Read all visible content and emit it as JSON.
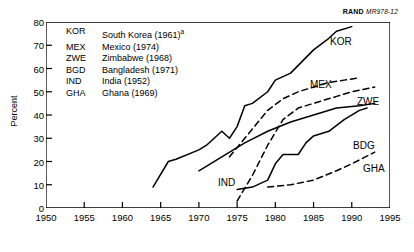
{
  "source_note": {
    "brand": "RAND",
    "id": "MR978-12"
  },
  "axes": {
    "ylabel": "Percent",
    "yticks": [
      0,
      10,
      20,
      30,
      40,
      50,
      60,
      70,
      80
    ],
    "xticks": [
      1950,
      1955,
      1960,
      1965,
      1970,
      1975,
      1980,
      1985,
      1990,
      1995
    ],
    "xlim": [
      1950,
      1995
    ],
    "ylim": [
      0,
      80
    ]
  },
  "legend": {
    "rows": [
      {
        "code": "KOR",
        "name": "South Korea (1961)",
        "footnote": "a"
      },
      {
        "code": "MEX",
        "name": "Mexico (1974)",
        "footnote": ""
      },
      {
        "code": "ZWE",
        "name": "Zimbabwe (1968)",
        "footnote": ""
      },
      {
        "code": "BGD",
        "name": "Bangladesh (1971)",
        "footnote": ""
      },
      {
        "code": "IND",
        "name": "India (1952)",
        "footnote": ""
      },
      {
        "code": "GHA",
        "name": "Ghana (1969)",
        "footnote": ""
      }
    ]
  },
  "series_labels": {
    "kor": "KOR",
    "mex": "MEX",
    "zwe": "ZWE",
    "bdg": "BDG",
    "ind": "IND",
    "gha": "GHA"
  },
  "chart_data": {
    "type": "line",
    "title": "",
    "xlabel": "",
    "ylabel": "Percent",
    "xlim": [
      1950,
      1995
    ],
    "ylim": [
      0,
      80
    ],
    "grid": false,
    "legend_position": "inside-top-left",
    "series": [
      {
        "name": "KOR",
        "label": "South Korea (1961)",
        "style": "solid",
        "points": [
          [
            1964,
            9
          ],
          [
            1966,
            20
          ],
          [
            1967,
            21
          ],
          [
            1970,
            25
          ],
          [
            1971,
            27
          ],
          [
            1972,
            30
          ],
          [
            1973,
            33
          ],
          [
            1974,
            30
          ],
          [
            1975,
            35
          ],
          [
            1976,
            44
          ],
          [
            1977,
            45
          ],
          [
            1979,
            50
          ],
          [
            1980,
            55
          ],
          [
            1982,
            58
          ],
          [
            1985,
            68
          ],
          [
            1987,
            73
          ],
          [
            1988,
            76
          ],
          [
            1990,
            78
          ]
        ]
      },
      {
        "name": "MEX",
        "label": "Mexico (1974)",
        "style": "dashed",
        "points": [
          [
            1974,
            22
          ],
          [
            1976,
            30
          ],
          [
            1978,
            38
          ],
          [
            1979,
            42
          ],
          [
            1981,
            47
          ],
          [
            1983,
            50
          ],
          [
            1985,
            52
          ],
          [
            1987,
            54
          ],
          [
            1989,
            55
          ],
          [
            1991,
            56
          ]
        ]
      },
      {
        "name": "ZWE",
        "label": "Zimbabwe (1968)",
        "style": "dashed",
        "points": [
          [
            1975,
            3
          ],
          [
            1977,
            14
          ],
          [
            1979,
            27
          ],
          [
            1981,
            38
          ],
          [
            1983,
            43
          ],
          [
            1985,
            45
          ],
          [
            1988,
            48
          ],
          [
            1990,
            50
          ],
          [
            1993,
            52
          ]
        ]
      },
      {
        "name": "BDG",
        "label": "Bangladesh (1971)",
        "style": "solid",
        "points": [
          [
            1975,
            8
          ],
          [
            1977,
            9
          ],
          [
            1979,
            12
          ],
          [
            1980,
            19
          ],
          [
            1981,
            23
          ],
          [
            1983,
            23
          ],
          [
            1984,
            28
          ],
          [
            1985,
            31
          ],
          [
            1987,
            33
          ],
          [
            1989,
            38
          ],
          [
            1991,
            42
          ],
          [
            1992,
            43
          ]
        ]
      },
      {
        "name": "IND",
        "label": "India (1952)",
        "style": "solid",
        "points": [
          [
            1970,
            16
          ],
          [
            1973,
            22
          ],
          [
            1976,
            28
          ],
          [
            1979,
            33
          ],
          [
            1982,
            37
          ],
          [
            1985,
            40
          ],
          [
            1988,
            43
          ],
          [
            1991,
            44
          ],
          [
            1993,
            45
          ]
        ]
      },
      {
        "name": "GHA",
        "label": "Ghana (1969)",
        "style": "dashed",
        "points": [
          [
            1979,
            9
          ],
          [
            1982,
            10
          ],
          [
            1985,
            12
          ],
          [
            1988,
            16
          ],
          [
            1990,
            19
          ],
          [
            1993,
            24
          ]
        ]
      }
    ]
  }
}
